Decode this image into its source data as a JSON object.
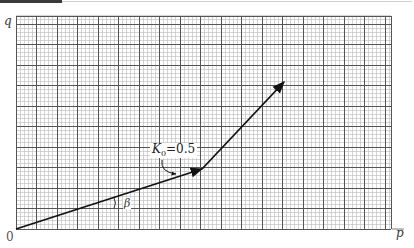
{
  "diagram": {
    "axes": {
      "y_label": "q",
      "x_label": "p",
      "origin_label": "0"
    },
    "grid": {
      "left": 16,
      "top": 16,
      "right": 391,
      "bottom": 229,
      "minor_step": 4.1,
      "major_every": 5,
      "minor_color": "#b9b9b9",
      "major_color": "#555555"
    },
    "path": {
      "points": [
        [
          16,
          229
        ],
        [
          202,
          169
        ],
        [
          284,
          82
        ]
      ],
      "color": "#111111"
    },
    "annotations": {
      "k_label": "K",
      "k_subscript": "0",
      "k_value": "=0.5",
      "angle_label": "β"
    }
  }
}
